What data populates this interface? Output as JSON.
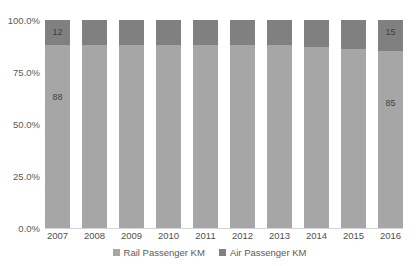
{
  "chart_data": {
    "type": "bar",
    "subtype": "100% stacked column",
    "title": "",
    "subtitle": "",
    "xlabel": "",
    "ylabel": "",
    "categories": [
      "2007",
      "2008",
      "2009",
      "2010",
      "2011",
      "2012",
      "2013",
      "2014",
      "2015",
      "2016"
    ],
    "series": [
      {
        "name": "Rail Passenger KM",
        "color": "#a6a6a6",
        "values": [
          88,
          88,
          88,
          88,
          88,
          88,
          88,
          87,
          86,
          85
        ],
        "labels": [
          "88",
          "",
          "",
          "",
          "",
          "",
          "",
          "",
          "",
          "85"
        ]
      },
      {
        "name": "Air Passenger KM",
        "color": "#808080",
        "values": [
          12,
          12,
          12,
          12,
          12,
          12,
          12,
          13,
          14,
          15
        ],
        "labels": [
          "12",
          "",
          "",
          "",
          "",
          "",
          "",
          "",
          "",
          "15"
        ]
      }
    ],
    "y_tick_labels": [
      "100.0%",
      "75.0%",
      "50.0%",
      "25.0%",
      "0.0%"
    ],
    "y_tick_values": [
      100,
      75,
      50,
      25,
      0
    ],
    "ylim": [
      0,
      100
    ],
    "grid": false,
    "legend_position": "bottom",
    "axis_line_color": "#d4d4d4",
    "background_color": "#ffffff"
  },
  "legend": {
    "items": [
      {
        "label": "Rail Passenger KM",
        "color": "#a6a6a6"
      },
      {
        "label": "Air Passenger KM",
        "color": "#808080"
      }
    ]
  }
}
